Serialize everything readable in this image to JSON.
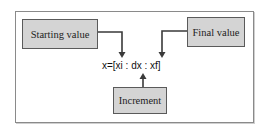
{
  "diagram": {
    "start_label": "Starting value",
    "final_label": "Final value",
    "increment_label": "Increment",
    "formula": "x=[xi : dx : xf]"
  },
  "colors": {
    "box_fill": "#d4d4d4",
    "box_border": "#5a5a5a",
    "arrow": "#3a3a3a",
    "frame": "#8a8a8a"
  }
}
